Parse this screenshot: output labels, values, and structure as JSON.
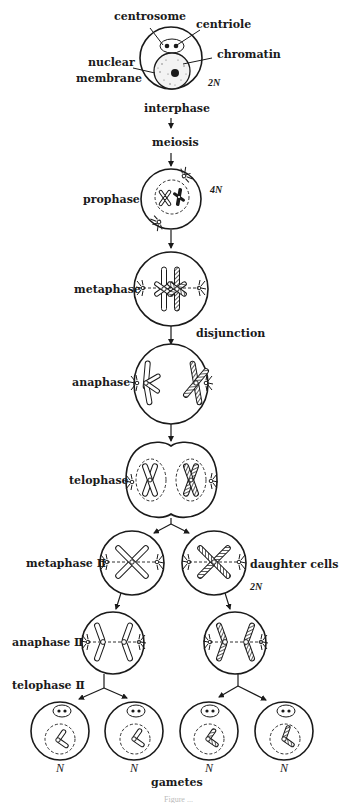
{
  "figure": {
    "type": "meiosis diagram",
    "caption_partial": "Figure ..."
  },
  "labels": {
    "centrosome": "centrosome",
    "centriole": "centriole",
    "chromatin": "chromatin",
    "nuclear_membrane_line1": "nuclear",
    "nuclear_membrane_line2": "membrane",
    "ploidy_interphase": "2N",
    "interphase": "interphase",
    "meiosis": "meiosis",
    "prophase": "prophase",
    "ploidy_prophase": "4N",
    "metaphase": "metaphase",
    "disjunction": "disjunction",
    "anaphase": "anaphase",
    "telophase": "telophase",
    "metaphase_ii": "metaphase Ⅱ",
    "daughter_cells": "daughter cells",
    "ploidy_daughter": "2N",
    "anaphase_ii": "anaphase Ⅱ",
    "telophase_ii": "telophase Ⅱ",
    "gamete_ploidy": [
      "N",
      "N",
      "N",
      "N"
    ],
    "gametes": "gametes"
  },
  "stages": [
    {
      "name": "interphase",
      "ploidy": "2N"
    },
    {
      "name": "prophase",
      "ploidy": "4N"
    },
    {
      "name": "metaphase"
    },
    {
      "name": "anaphase",
      "note": "disjunction"
    },
    {
      "name": "telophase"
    },
    {
      "name": "metaphase II",
      "note": "daughter cells",
      "ploidy": "2N"
    },
    {
      "name": "anaphase II"
    },
    {
      "name": "telophase II"
    },
    {
      "name": "gametes",
      "ploidy": "N",
      "count": 4
    }
  ]
}
